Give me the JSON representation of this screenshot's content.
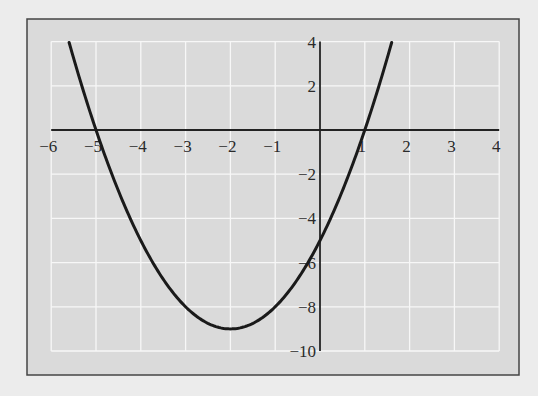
{
  "chart_data": {
    "type": "line",
    "title": "",
    "xlabel": "",
    "ylabel": "",
    "function": "y = x^2 + 4x - 5",
    "xlim": [
      -6,
      4
    ],
    "ylim": [
      -10,
      4
    ],
    "grid": true,
    "legend": null,
    "x_ticks": [
      -6,
      -5,
      -4,
      -3,
      -2,
      -1,
      1,
      2,
      3,
      4
    ],
    "x_tick_labels": [
      "−6",
      "−5",
      "−4",
      "−3",
      "−2",
      "−1",
      "1",
      "2",
      "3",
      "4"
    ],
    "y_ticks": [
      4,
      2,
      -2,
      -4,
      -6,
      -8,
      -10
    ],
    "y_tick_labels": [
      "4",
      "2",
      "−2",
      "−4",
      "−6",
      "−8",
      "−10"
    ],
    "series": [
      {
        "name": "parabola",
        "x": [
          -5.6,
          -5,
          -4,
          -3,
          -2,
          -1,
          0,
          1,
          1.6
        ],
        "y": [
          3.96,
          0,
          -5,
          -8,
          -9,
          -8,
          -5,
          0,
          3.96
        ]
      }
    ],
    "key_points": {
      "x_intercepts": [
        -5,
        1
      ],
      "y_intercept": -5,
      "vertex": [
        -2,
        -9
      ]
    },
    "colors": {
      "background": "#ececec",
      "plot_area": "#d9d9d9",
      "grid": "#f7f7f7",
      "axis": "#222222",
      "curve": "#1a1a1a",
      "frame": "#444444"
    }
  }
}
